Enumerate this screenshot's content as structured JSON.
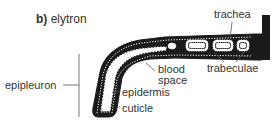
{
  "title": {
    "prefix": "b)",
    "name": "elytron"
  },
  "labels": {
    "trachea": "trachea",
    "blood_space_1": "blood",
    "blood_space_2": "space",
    "trabeculae": "trabeculae",
    "epipleuron": "epipleuron",
    "epidermis": "epidermis",
    "cuticle": "cuticle"
  },
  "colors": {
    "cuticle": "#1a1a1a",
    "epidermis": "#ffffff",
    "text": "#333333",
    "leader": "#555555"
  }
}
